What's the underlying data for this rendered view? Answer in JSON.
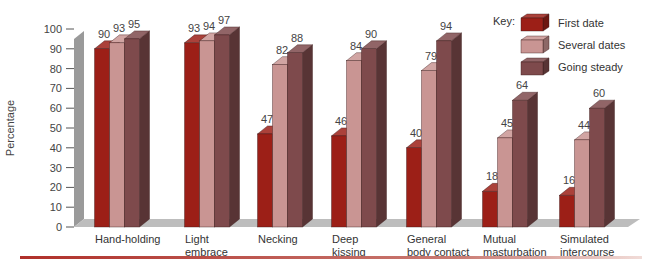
{
  "chart_data": {
    "type": "bar",
    "title": "",
    "xlabel": "",
    "ylabel": "Percentage",
    "ylim": [
      0,
      100
    ],
    "yticks": [
      0,
      10,
      20,
      30,
      40,
      50,
      60,
      70,
      80,
      90,
      100
    ],
    "grid": false,
    "legend_position": "top-right",
    "legend_title": "Key:",
    "categories": [
      [
        "Hand-holding"
      ],
      [
        "Light",
        "embrace"
      ],
      [
        "Necking"
      ],
      [
        "Deep",
        "kissing"
      ],
      [
        "General",
        "body contact"
      ],
      [
        "Mutual",
        "masturbation"
      ],
      [
        "Simulated",
        "intercourse"
      ]
    ],
    "series": [
      {
        "name": "First date",
        "color": "#9c1f17",
        "values": [
          90,
          93,
          47,
          46,
          40,
          18,
          16
        ]
      },
      {
        "name": "Several dates",
        "color": "#c99593",
        "values": [
          93,
          94,
          82,
          84,
          79,
          45,
          44
        ]
      },
      {
        "name": "Going steady",
        "color": "#7e4a4c",
        "values": [
          95,
          97,
          88,
          90,
          94,
          64,
          60
        ]
      }
    ]
  },
  "colors": {
    "floor": "#bdbdbd",
    "wall": "#9a9a9a",
    "rule": "#b0302a"
  }
}
